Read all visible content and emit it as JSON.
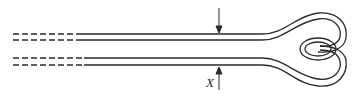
{
  "diagram": {
    "type": "hairpin-loop-tape",
    "label_x": "X",
    "stroke_color": "#2a2a2a",
    "background": "#ffffff",
    "elements": [
      "dashed-left-extension-top-pair",
      "dashed-left-extension-bottom-pair",
      "solid-parallel-strips",
      "looped-end-right",
      "dimension-arrow-top",
      "dimension-arrow-bottom"
    ]
  }
}
